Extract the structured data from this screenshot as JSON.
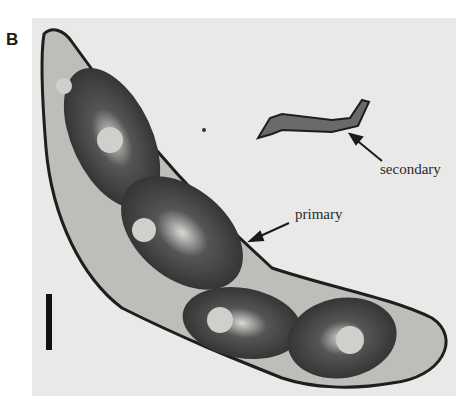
{
  "figure": {
    "panel_label": "B",
    "labels": {
      "primary": "primary",
      "secondary": "secondary"
    },
    "colors": {
      "background": "#e9e9e7",
      "specimen_dark": "#2b2b2b",
      "specimen_mid": "#6e6e6e",
      "outline": "#1e1e1e"
    }
  }
}
